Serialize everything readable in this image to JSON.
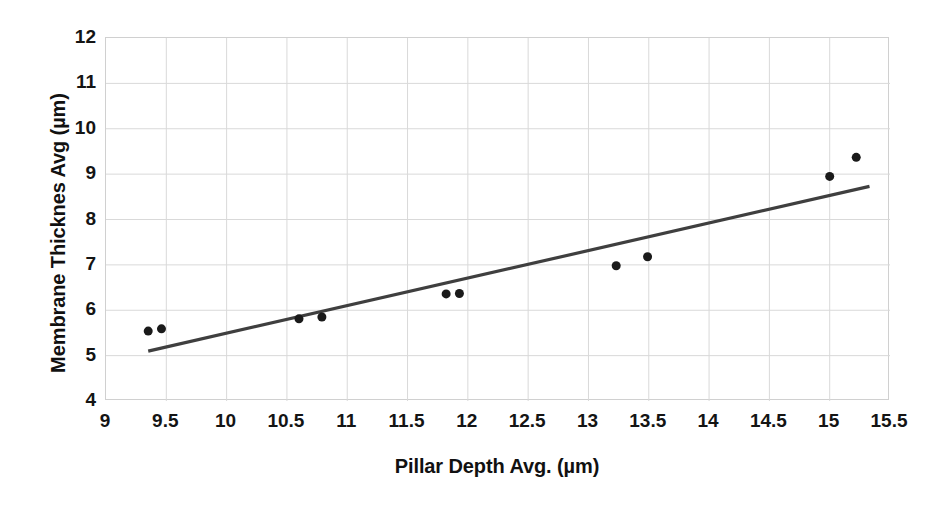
{
  "chart_data": {
    "type": "scatter",
    "title": "",
    "xlabel": "Pillar Depth Avg. (µm)",
    "ylabel": "Membrane Thicknes Avg (µm)",
    "xlim": [
      9,
      15.5
    ],
    "ylim": [
      4,
      12
    ],
    "xticks": [
      "9",
      "9.5",
      "10",
      "10.5",
      "11",
      "11.5",
      "12",
      "12.5",
      "13",
      "13.5",
      "14",
      "14.5",
      "15",
      "15.5"
    ],
    "xtick_values": [
      9,
      9.5,
      10,
      10.5,
      11,
      11.5,
      12,
      12.5,
      13,
      13.5,
      14,
      14.5,
      15,
      15.5
    ],
    "yticks": [
      "4",
      "5",
      "6",
      "7",
      "8",
      "9",
      "10",
      "11",
      "12"
    ],
    "ytick_values": [
      4,
      5,
      6,
      7,
      8,
      9,
      10,
      11,
      12
    ],
    "grid": true,
    "legend": "none",
    "marker_color": "#1a1a1a",
    "marker_size": 9,
    "trendline_color": "#3f3f3f",
    "grid_color": "#d9d9d9",
    "points": [
      {
        "x": 9.35,
        "y": 5.54
      },
      {
        "x": 9.46,
        "y": 5.59
      },
      {
        "x": 10.6,
        "y": 5.81
      },
      {
        "x": 10.79,
        "y": 5.85
      },
      {
        "x": 11.82,
        "y": 6.36
      },
      {
        "x": 11.93,
        "y": 6.37
      },
      {
        "x": 13.23,
        "y": 6.98
      },
      {
        "x": 13.49,
        "y": 7.18
      },
      {
        "x": 15.0,
        "y": 8.95
      },
      {
        "x": 15.22,
        "y": 9.37
      }
    ],
    "trendline": {
      "x0": 9.35,
      "y0": 5.1,
      "x1": 15.33,
      "y1": 8.73
    }
  }
}
